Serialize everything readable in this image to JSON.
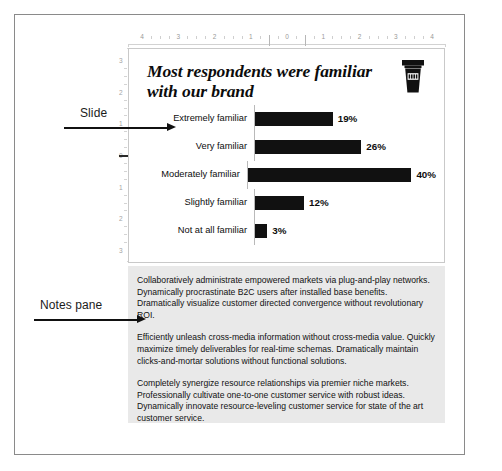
{
  "annotations": [
    {
      "id": "slide",
      "label": "Slide"
    },
    {
      "id": "notes",
      "label": "Notes pane"
    }
  ],
  "rulers": {
    "horizontal": {
      "labels": [
        "4",
        "3",
        "2",
        "1",
        "0",
        "1",
        "2",
        "3",
        "4"
      ]
    },
    "vertical": {
      "labels": [
        "3",
        "2",
        "1",
        "0",
        "1",
        "2",
        "3"
      ]
    }
  },
  "slide": {
    "title": "Most respondents were familiar with our brand",
    "brand_icon": "coffee-cup-icon"
  },
  "chart_data": {
    "type": "bar",
    "orientation": "horizontal",
    "title": "Most respondents were familiar with our brand",
    "xlabel": "",
    "ylabel": "",
    "categories": [
      "Extremely familiar",
      "Very familiar",
      "Moderately familiar",
      "Slightly familiar",
      "Not at all familiar"
    ],
    "values": [
      19,
      26,
      40,
      12,
      3
    ],
    "value_labels": [
      "19%",
      "26%",
      "40%",
      "12%",
      "3%"
    ],
    "xlim": [
      0,
      44
    ],
    "grid": false,
    "legend": null,
    "bar_color": "#111111"
  },
  "notes": {
    "paragraphs": [
      "Collaboratively administrate empowered markets via plug-and-play networks. Dynamically procrastinate B2C users after installed base benefits. Dramatically visualize customer directed convergence without revolutionary ROI.",
      "Efficiently unleash cross-media information without cross-media value. Quickly maximize timely deliverables for real-time schemas. Dramatically maintain clicks-and-mortar solutions without functional solutions.",
      "Completely synergize resource relationships via premier niche markets. Professionally cultivate one-to-one customer service with robust ideas. Dynamically innovate resource-leveling customer service for state of the art customer service."
    ]
  }
}
